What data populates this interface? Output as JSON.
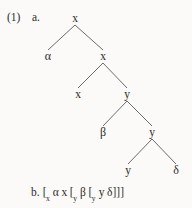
{
  "example": {
    "number": "(1)",
    "part_a_label": "a.",
    "part_b_label": "b."
  },
  "colors": {
    "background": "#fbfaf8",
    "ink": "#2e2c2a",
    "edge": "#5d5b59"
  },
  "tree": {
    "nodes": [
      {
        "id": "n0",
        "label": "x",
        "x": 75,
        "y": 19,
        "kind": "nonterminal"
      },
      {
        "id": "n1",
        "label": "α",
        "x": 48,
        "y": 57,
        "kind": "terminal"
      },
      {
        "id": "n2",
        "label": "x",
        "x": 103,
        "y": 57,
        "kind": "nonterminal"
      },
      {
        "id": "n3",
        "label": "x",
        "x": 78,
        "y": 95,
        "kind": "terminal"
      },
      {
        "id": "n4",
        "label": "y",
        "x": 127,
        "y": 95,
        "kind": "nonterminal"
      },
      {
        "id": "n5",
        "label": "β",
        "x": 103,
        "y": 133,
        "kind": "terminal"
      },
      {
        "id": "n6",
        "label": "y",
        "x": 152,
        "y": 133,
        "kind": "nonterminal"
      },
      {
        "id": "n7",
        "label": "y",
        "x": 128,
        "y": 171,
        "kind": "terminal"
      },
      {
        "id": "n8",
        "label": "δ",
        "x": 176,
        "y": 171,
        "kind": "terminal"
      }
    ],
    "edges": [
      {
        "from": "n0",
        "to": "n1"
      },
      {
        "from": "n0",
        "to": "n2"
      },
      {
        "from": "n2",
        "to": "n3"
      },
      {
        "from": "n2",
        "to": "n4"
      },
      {
        "from": "n4",
        "to": "n5"
      },
      {
        "from": "n4",
        "to": "n6"
      },
      {
        "from": "n6",
        "to": "n7"
      },
      {
        "from": "n6",
        "to": "n8"
      }
    ]
  },
  "bracket_notation": {
    "plain": "[x α x [y β [y y δ]]]",
    "tokens": [
      {
        "text": "[",
        "type": "bracket"
      },
      {
        "text": "x",
        "type": "subscript"
      },
      {
        "text": " ",
        "type": "space"
      },
      {
        "text": "α",
        "type": "symbol"
      },
      {
        "text": " ",
        "type": "space"
      },
      {
        "text": "x",
        "type": "symbol"
      },
      {
        "text": " ",
        "type": "space"
      },
      {
        "text": "[",
        "type": "bracket"
      },
      {
        "text": "y",
        "type": "subscript"
      },
      {
        "text": " ",
        "type": "space"
      },
      {
        "text": "β",
        "type": "symbol"
      },
      {
        "text": " ",
        "type": "space"
      },
      {
        "text": "[",
        "type": "bracket"
      },
      {
        "text": "y",
        "type": "subscript"
      },
      {
        "text": " ",
        "type": "space"
      },
      {
        "text": "y",
        "type": "symbol"
      },
      {
        "text": " ",
        "type": "space"
      },
      {
        "text": "δ",
        "type": "symbol"
      },
      {
        "text": "]",
        "type": "bracket"
      },
      {
        "text": "]",
        "type": "bracket"
      },
      {
        "text": "]",
        "type": "bracket"
      }
    ]
  }
}
